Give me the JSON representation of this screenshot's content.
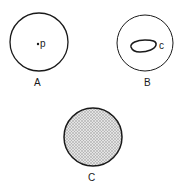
{
  "figures": [
    {
      "id": "A",
      "label": "A",
      "point_label": "p",
      "description": "circle containing a point p"
    },
    {
      "id": "B",
      "label": "B",
      "curve_label": "c",
      "description": "circle containing a closed curve c"
    },
    {
      "id": "C",
      "label": "C",
      "description": "filled (shaded) disk"
    }
  ],
  "colors": {
    "stroke": "#1a1a1a",
    "fill_shade": "#bdbdbd",
    "background": "#ffffff"
  }
}
